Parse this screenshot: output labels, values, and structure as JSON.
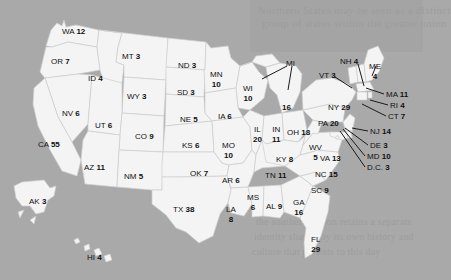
{
  "map": {
    "title": "United States Electoral College Votes by State",
    "background_color": "#a9a9a9",
    "state_fill": "#f4f4f4",
    "state_border": "#cfcfcf",
    "label_color": "#111111",
    "total_electoral_votes": 538
  },
  "background_ghost_text": {
    "line1": "Northern States may be seen as a distinct",
    "line2": "group of states within the greater union",
    "line3": "the southern region retains a separate",
    "line4": "identity shaped by its own history and",
    "line5": "culture that persists to this day"
  },
  "chart_data": {
    "type": "map",
    "value_label": "Electoral Votes",
    "total": 538,
    "categories": [
      "WA",
      "OR",
      "CA",
      "NV",
      "ID",
      "MT",
      "WY",
      "UT",
      "AZ",
      "CO",
      "NM",
      "ND",
      "SD",
      "NE",
      "KS",
      "OK",
      "TX",
      "MN",
      "IA",
      "MO",
      "AR",
      "LA",
      "WI",
      "IL",
      "MS",
      "AL",
      "MI",
      "IN",
      "OH",
      "KY",
      "TN",
      "GA",
      "FL",
      "SC",
      "NC",
      "VA",
      "WV",
      "PA",
      "NY",
      "VT",
      "NH",
      "ME",
      "MA",
      "RI",
      "CT",
      "NJ",
      "DE",
      "MD",
      "D.C.",
      "AK",
      "HI"
    ],
    "values": [
      12,
      7,
      55,
      6,
      4,
      3,
      3,
      6,
      11,
      9,
      5,
      3,
      3,
      5,
      6,
      7,
      38,
      10,
      6,
      10,
      6,
      8,
      10,
      20,
      6,
      9,
      16,
      11,
      18,
      8,
      11,
      16,
      29,
      9,
      15,
      13,
      5,
      20,
      29,
      3,
      4,
      4,
      11,
      4,
      7,
      14,
      3,
      10,
      3,
      3,
      4
    ]
  },
  "states": [
    {
      "id": "WA",
      "abbr": "WA",
      "votes": "12",
      "x": 62,
      "y": 27,
      "layout": "inline"
    },
    {
      "id": "OR",
      "abbr": "OR",
      "votes": "7",
      "x": 51,
      "y": 57,
      "layout": "inline"
    },
    {
      "id": "ID",
      "abbr": "ID",
      "votes": "4",
      "x": 88,
      "y": 74,
      "layout": "inline"
    },
    {
      "id": "MT",
      "abbr": "MT",
      "votes": "3",
      "x": 122,
      "y": 52,
      "layout": "inline"
    },
    {
      "id": "ND",
      "abbr": "ND",
      "votes": "3",
      "x": 178,
      "y": 61,
      "layout": "inline"
    },
    {
      "id": "SD",
      "abbr": "SD",
      "votes": "3",
      "x": 177,
      "y": 88,
      "layout": "inline"
    },
    {
      "id": "NE",
      "abbr": "NE",
      "votes": "5",
      "x": 180,
      "y": 115,
      "layout": "inline"
    },
    {
      "id": "WY",
      "abbr": "WY",
      "votes": "3",
      "x": 127,
      "y": 92,
      "layout": "inline"
    },
    {
      "id": "NV",
      "abbr": "NV",
      "votes": "6",
      "x": 62,
      "y": 109,
      "layout": "inline"
    },
    {
      "id": "UT",
      "abbr": "UT",
      "votes": "6",
      "x": 95,
      "y": 121,
      "layout": "inline"
    },
    {
      "id": "CO",
      "abbr": "CO",
      "votes": "9",
      "x": 135,
      "y": 132,
      "layout": "inline"
    },
    {
      "id": "CA",
      "abbr": "CA",
      "votes": "55",
      "x": 38,
      "y": 140,
      "layout": "inline"
    },
    {
      "id": "AZ",
      "abbr": "AZ",
      "votes": "11",
      "x": 84,
      "y": 163,
      "layout": "inline"
    },
    {
      "id": "NM",
      "abbr": "NM",
      "votes": "5",
      "x": 124,
      "y": 172,
      "layout": "inline"
    },
    {
      "id": "KS",
      "abbr": "KS",
      "votes": "6",
      "x": 182,
      "y": 141,
      "layout": "inline"
    },
    {
      "id": "OK",
      "abbr": "OK",
      "votes": "7",
      "x": 190,
      "y": 169,
      "layout": "inline"
    },
    {
      "id": "TX",
      "abbr": "TX",
      "votes": "38",
      "x": 173,
      "y": 205,
      "layout": "inline"
    },
    {
      "id": "MN",
      "abbr": "MN",
      "votes": "10",
      "x": 210,
      "y": 70,
      "layout": "stack"
    },
    {
      "id": "WI",
      "abbr": "WI",
      "votes": "10",
      "x": 243,
      "y": 84,
      "layout": "stack"
    },
    {
      "id": "IA",
      "abbr": "IA",
      "votes": "6",
      "x": 218,
      "y": 112,
      "layout": "inline"
    },
    {
      "id": "MO",
      "abbr": "MO",
      "votes": "10",
      "x": 222,
      "y": 141,
      "layout": "stack"
    },
    {
      "id": "AR",
      "abbr": "AR",
      "votes": "6",
      "x": 222,
      "y": 176,
      "layout": "inline"
    },
    {
      "id": "LA",
      "abbr": "LA",
      "votes": "8",
      "x": 226,
      "y": 205,
      "layout": "stack"
    },
    {
      "id": "MS",
      "abbr": "MS",
      "votes": "6",
      "x": 247,
      "y": 193,
      "layout": "stack"
    },
    {
      "id": "AL",
      "abbr": "AL",
      "votes": "9",
      "x": 266,
      "y": 202,
      "layout": "inline"
    },
    {
      "id": "IL",
      "abbr": "IL",
      "votes": "20",
      "x": 253,
      "y": 125,
      "layout": "stack"
    },
    {
      "id": "IN",
      "abbr": "IN",
      "votes": "11",
      "x": 272,
      "y": 125,
      "layout": "stack"
    },
    {
      "id": "OH",
      "abbr": "OH",
      "votes": "18",
      "x": 287,
      "y": 128,
      "layout": "inline"
    },
    {
      "id": "MI",
      "abbr": "MI",
      "votes": "16",
      "x": 286,
      "y": 59,
      "layout": "leader-split"
    },
    {
      "id": "KY",
      "abbr": "KY",
      "votes": "8",
      "x": 276,
      "y": 155,
      "layout": "inline"
    },
    {
      "id": "TN",
      "abbr": "TN",
      "votes": "11",
      "x": 265,
      "y": 171,
      "layout": "inline"
    },
    {
      "id": "GA",
      "abbr": "GA",
      "votes": "16",
      "x": 293,
      "y": 198,
      "layout": "stack"
    },
    {
      "id": "SC",
      "abbr": "SC",
      "votes": "9",
      "x": 311,
      "y": 186,
      "layout": "inline"
    },
    {
      "id": "NC",
      "abbr": "NC",
      "votes": "15",
      "x": 315,
      "y": 170,
      "layout": "inline"
    },
    {
      "id": "FL",
      "abbr": "FL",
      "votes": "29",
      "x": 311,
      "y": 235,
      "layout": "stack"
    },
    {
      "id": "WV",
      "abbr": "WV",
      "votes": "5",
      "x": 309,
      "y": 143,
      "layout": "stack"
    },
    {
      "id": "VA",
      "abbr": "VA",
      "votes": "13",
      "x": 320,
      "y": 154,
      "layout": "inline"
    },
    {
      "id": "PA",
      "abbr": "PA",
      "votes": "20",
      "x": 318,
      "y": 119,
      "layout": "inline"
    },
    {
      "id": "NY",
      "abbr": "NY",
      "votes": "29",
      "x": 328,
      "y": 103,
      "layout": "inline"
    },
    {
      "id": "VT",
      "abbr": "VT",
      "votes": "3",
      "x": 319,
      "y": 71,
      "layout": "leader"
    },
    {
      "id": "NH",
      "abbr": "NH",
      "votes": "4",
      "x": 340,
      "y": 57,
      "layout": "leader"
    },
    {
      "id": "ME",
      "abbr": "ME",
      "votes": "4",
      "x": 369,
      "y": 62,
      "layout": "stack"
    },
    {
      "id": "MA",
      "abbr": "MA",
      "votes": "11",
      "x": 386,
      "y": 90,
      "layout": "leader"
    },
    {
      "id": "RI",
      "abbr": "RI",
      "votes": "4",
      "x": 390,
      "y": 101,
      "layout": "leader"
    },
    {
      "id": "CT",
      "abbr": "CT",
      "votes": "7",
      "x": 388,
      "y": 112,
      "layout": "leader"
    },
    {
      "id": "NJ",
      "abbr": "NJ",
      "votes": "14",
      "x": 370,
      "y": 127,
      "layout": "leader"
    },
    {
      "id": "DE",
      "abbr": "DE",
      "votes": "3",
      "x": 370,
      "y": 141,
      "layout": "leader"
    },
    {
      "id": "MD",
      "abbr": "MD",
      "votes": "10",
      "x": 367,
      "y": 152,
      "layout": "leader"
    },
    {
      "id": "D.C.",
      "abbr": "D.C.",
      "votes": "3",
      "x": 367,
      "y": 163,
      "layout": "leader"
    },
    {
      "id": "AK",
      "abbr": "AK",
      "votes": "3",
      "x": 29,
      "y": 197,
      "layout": "inline"
    },
    {
      "id": "HI",
      "abbr": "HI",
      "votes": "4",
      "x": 87,
      "y": 253,
      "layout": "inline"
    }
  ]
}
